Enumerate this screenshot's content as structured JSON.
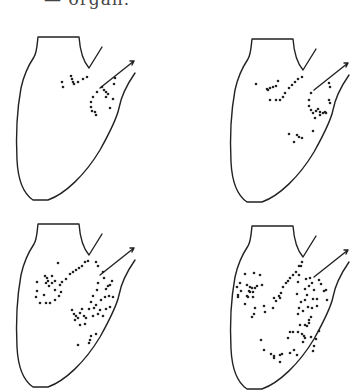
{
  "caption": "— organ.",
  "colors": {
    "ink": "#222222",
    "background": "#ffffff"
  },
  "outline": {
    "body": "M38,37 L79,37 C80,50 82,60 89,68 L102,47 M38,37 C37,45 37,52 34,57 C28,66 24,74 21,88 C17,110 16,140 17,160 C18,180 24,194 33,200 L48,200 C65,194 85,175 100,150 C110,132 117,118 119,108 C121,97 126,86 135,73",
    "arrow": "M100,88 L134,61 M130,61 L134,61 L132,65"
  },
  "panels": [
    {
      "id": "top-left",
      "dx": 0,
      "dy": 0,
      "dots": [
        [
          62,
          82
        ],
        [
          63,
          87
        ],
        [
          71,
          76
        ],
        [
          72,
          79
        ],
        [
          73,
          82
        ],
        [
          74,
          84
        ],
        [
          78,
          82
        ],
        [
          83,
          79
        ],
        [
          87,
          77
        ],
        [
          102,
          87
        ],
        [
          97,
          92
        ],
        [
          93,
          97
        ],
        [
          91,
          102
        ],
        [
          91,
          107
        ],
        [
          92,
          111
        ],
        [
          95,
          112
        ],
        [
          96,
          115
        ],
        [
          104,
          90
        ],
        [
          106,
          92
        ],
        [
          108,
          94
        ],
        [
          106,
          97
        ],
        [
          114,
          84
        ],
        [
          113,
          99
        ],
        [
          115,
          78
        ],
        [
          110,
          108
        ]
      ]
    },
    {
      "id": "top-right",
      "dx": 214,
      "dy": 2,
      "dots": [
        [
          42,
          82
        ],
        [
          53,
          87
        ],
        [
          54,
          88
        ],
        [
          56,
          86
        ],
        [
          59,
          85
        ],
        [
          62,
          84
        ],
        [
          64,
          79
        ],
        [
          56,
          98
        ],
        [
          62,
          98
        ],
        [
          66,
          98
        ],
        [
          69,
          95
        ],
        [
          71,
          91
        ],
        [
          75,
          86
        ],
        [
          78,
          83
        ],
        [
          81,
          80
        ],
        [
          84,
          77
        ],
        [
          88,
          75
        ],
        [
          97,
          91
        ],
        [
          95,
          98
        ],
        [
          95,
          104
        ],
        [
          97,
          108
        ],
        [
          99,
          111
        ],
        [
          102,
          109
        ],
        [
          104,
          107
        ],
        [
          106,
          110
        ],
        [
          109,
          111
        ],
        [
          101,
          116
        ],
        [
          106,
          113
        ],
        [
          116,
          101
        ],
        [
          111,
          110
        ],
        [
          115,
          98
        ],
        [
          112,
          111
        ],
        [
          115,
          81
        ],
        [
          116,
          85
        ],
        [
          75,
          132
        ],
        [
          83,
          133
        ],
        [
          85,
          135
        ],
        [
          88,
          136
        ],
        [
          80,
          140
        ],
        [
          99,
          129
        ]
      ]
    },
    {
      "id": "bottom-left",
      "dx": 0,
      "dy": 187,
      "dots": [
        [
          58,
          76
        ],
        [
          85,
          75
        ],
        [
          88,
          74
        ],
        [
          79,
          81
        ],
        [
          82,
          79
        ],
        [
          76,
          83
        ],
        [
          73,
          85
        ],
        [
          70,
          87
        ],
        [
          66,
          92
        ],
        [
          62,
          95
        ],
        [
          60,
          98
        ],
        [
          37,
          95
        ],
        [
          45,
          89
        ],
        [
          47,
          91
        ],
        [
          48,
          94
        ],
        [
          46,
          96
        ],
        [
          49,
          99
        ],
        [
          52,
          96
        ],
        [
          55,
          94
        ],
        [
          52,
          89
        ],
        [
          55,
          103
        ],
        [
          37,
          104
        ],
        [
          36,
          110
        ],
        [
          44,
          108
        ],
        [
          40,
          116
        ],
        [
          46,
          116
        ],
        [
          50,
          116
        ],
        [
          55,
          113
        ],
        [
          59,
          109
        ],
        [
          61,
          105
        ],
        [
          98,
          79
        ],
        [
          96,
          75
        ],
        [
          103,
          85
        ],
        [
          104,
          91
        ],
        [
          108,
          99
        ],
        [
          106,
          102
        ],
        [
          98,
          96
        ],
        [
          97,
          103
        ],
        [
          101,
          113
        ],
        [
          105,
          110
        ],
        [
          109,
          109
        ],
        [
          113,
          110
        ],
        [
          93,
          109
        ],
        [
          91,
          115
        ],
        [
          89,
          122
        ],
        [
          94,
          121
        ],
        [
          96,
          118
        ],
        [
          93,
          129
        ],
        [
          98,
          127
        ],
        [
          100,
          123
        ],
        [
          106,
          122
        ],
        [
          103,
          129
        ],
        [
          110,
          120
        ],
        [
          110,
          98
        ],
        [
          112,
          94
        ],
        [
          82,
          122
        ],
        [
          72,
          123
        ],
        [
          74,
          127
        ],
        [
          76,
          129
        ],
        [
          78,
          131
        ],
        [
          80,
          126
        ],
        [
          84,
          129
        ],
        [
          86,
          131
        ],
        [
          85,
          137
        ],
        [
          80,
          138
        ],
        [
          75,
          133
        ],
        [
          96,
          147
        ],
        [
          91,
          149
        ],
        [
          90,
          153
        ],
        [
          89,
          156
        ],
        [
          78,
          158
        ]
      ]
    },
    {
      "id": "bottom-right",
      "dx": 214,
      "dy": 189,
      "dots": [
        [
          31,
          85
        ],
        [
          40,
          84
        ],
        [
          46,
          86
        ],
        [
          26,
          94
        ],
        [
          23,
          98
        ],
        [
          27,
          102
        ],
        [
          24,
          106
        ],
        [
          33,
          96
        ],
        [
          36,
          98
        ],
        [
          38,
          99
        ],
        [
          41,
          99
        ],
        [
          43,
          97
        ],
        [
          35,
          102
        ],
        [
          39,
          103
        ],
        [
          33,
          107
        ],
        [
          36,
          103
        ],
        [
          39,
          108
        ],
        [
          48,
          96
        ],
        [
          34,
          108
        ],
        [
          24,
          108
        ],
        [
          31,
          115
        ],
        [
          41,
          119
        ],
        [
          40,
          125
        ],
        [
          38,
          128
        ],
        [
          51,
          123
        ],
        [
          50,
          117
        ],
        [
          59,
          119
        ],
        [
          62,
          112
        ],
        [
          66,
          109
        ],
        [
          60,
          109
        ],
        [
          65,
          107
        ],
        [
          67,
          104
        ],
        [
          69,
          98
        ],
        [
          72,
          94
        ],
        [
          74,
          92
        ],
        [
          76,
          89
        ],
        [
          79,
          86
        ],
        [
          82,
          83
        ],
        [
          85,
          77
        ],
        [
          88,
          73
        ],
        [
          87,
          77
        ],
        [
          85,
          86
        ],
        [
          84,
          93
        ],
        [
          92,
          90
        ],
        [
          96,
          89
        ],
        [
          98,
          94
        ],
        [
          100,
          101
        ],
        [
          95,
          97
        ],
        [
          91,
          100
        ],
        [
          105,
          91
        ],
        [
          107,
          95
        ],
        [
          110,
          102
        ],
        [
          112,
          101
        ],
        [
          113,
          111
        ],
        [
          99,
          110
        ],
        [
          83,
          105
        ],
        [
          93,
          106
        ],
        [
          91,
          111
        ],
        [
          87,
          113
        ],
        [
          85,
          119
        ],
        [
          84,
          125
        ],
        [
          89,
          122
        ],
        [
          94,
          118
        ],
        [
          98,
          119
        ],
        [
          103,
          117
        ],
        [
          103,
          110
        ],
        [
          97,
          128
        ],
        [
          95,
          131
        ],
        [
          91,
          136
        ],
        [
          93,
          137
        ],
        [
          95,
          134
        ],
        [
          86,
          136
        ],
        [
          84,
          143
        ],
        [
          88,
          145
        ],
        [
          90,
          147
        ],
        [
          91,
          149
        ],
        [
          89,
          153
        ],
        [
          76,
          143
        ],
        [
          74,
          149
        ],
        [
          79,
          143
        ],
        [
          97,
          148
        ],
        [
          102,
          150
        ],
        [
          105,
          142
        ],
        [
          100,
          157
        ],
        [
          99,
          162
        ],
        [
          47,
          151
        ],
        [
          50,
          161
        ],
        [
          57,
          165
        ],
        [
          60,
          167
        ],
        [
          60,
          169
        ],
        [
          66,
          166
        ],
        [
          68,
          165
        ],
        [
          66,
          173
        ],
        [
          76,
          164
        ],
        [
          80,
          161
        ],
        [
          83,
          166
        ]
      ]
    }
  ]
}
